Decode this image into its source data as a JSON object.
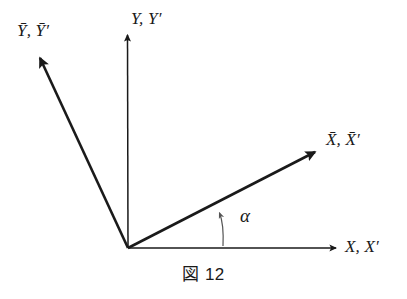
{
  "figure": {
    "caption": "図 12",
    "background_color": "#ffffff",
    "stroke_color": "#1a1a1a",
    "thin_stroke_width": 1.5,
    "thick_stroke_width": 2.6,
    "origin": {
      "x": 128,
      "y": 248
    }
  },
  "labels": {
    "y_bar": "Ȳ, Ȳ′",
    "y": "Y, Y′",
    "x_bar": "X̄, X̄′",
    "x": "X, X′",
    "alpha": "α"
  },
  "diagram_data": {
    "type": "diagram",
    "subject": "rotated-coordinate-axes",
    "origin": {
      "x": 128,
      "y": 248
    },
    "axes": [
      {
        "name": "x-axis",
        "label": "X, X′",
        "barred": false,
        "from": {
          "x": 128,
          "y": 248
        },
        "to": {
          "x": 338,
          "y": 248
        },
        "angle_deg": 0,
        "stroke_width": 1.5,
        "arrowhead": "end"
      },
      {
        "name": "y-axis",
        "label": "Y, Y′",
        "barred": false,
        "from": {
          "x": 128,
          "y": 248
        },
        "to": {
          "x": 127,
          "y": 32
        },
        "angle_deg": 90,
        "stroke_width": 1.5,
        "arrowhead": "end"
      },
      {
        "name": "x-bar-axis",
        "label": "X̄, X̄′",
        "barred": true,
        "from": {
          "x": 128,
          "y": 248
        },
        "to": {
          "x": 318,
          "y": 150
        },
        "angle_deg": 27,
        "stroke_width": 2.6,
        "arrowhead": "end"
      },
      {
        "name": "y-bar-axis",
        "label": "Ȳ, Ȳ′",
        "barred": true,
        "from": {
          "x": 128,
          "y": 248
        },
        "to": {
          "x": 37,
          "y": 54
        },
        "angle_deg": 115,
        "stroke_width": 2.6,
        "arrowhead": "end"
      }
    ],
    "angle_arc": {
      "name": "alpha-angle",
      "label": "α",
      "between": [
        "x-axis",
        "x-bar-axis"
      ],
      "from": {
        "x": 222,
        "y": 247
      },
      "to": {
        "x": 219,
        "y": 210
      },
      "arrowhead": "end",
      "stroke_width": 1.2
    }
  }
}
